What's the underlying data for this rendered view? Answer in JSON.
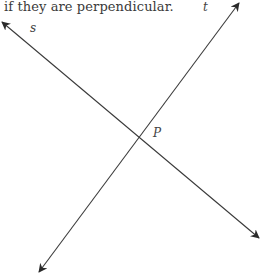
{
  "caption": "if they are perpendicular.",
  "diagram": {
    "lines": [
      {
        "name": "s",
        "label": "s",
        "from": [
          2,
          22
        ],
        "to": [
          259,
          238
        ],
        "arrows": "both"
      },
      {
        "name": "t",
        "label": "t",
        "from": [
          239,
          3
        ],
        "to": [
          39,
          272
        ],
        "arrows": "both"
      }
    ],
    "intersection": {
      "label": "P",
      "point": [
        143,
        136
      ]
    },
    "stroke_color": "#3a3a3a"
  }
}
